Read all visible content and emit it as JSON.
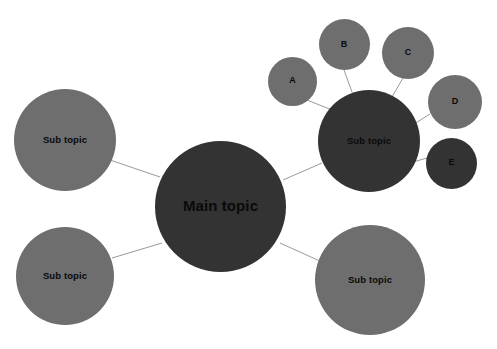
{
  "diagram": {
    "title_text": "Main topic",
    "type": "mind-map",
    "background_color": "#ffffff",
    "link_color": "#9a9a9a",
    "palette": {
      "dark": "#333333",
      "light": "#6e6e6e",
      "text": "#0a0a0a"
    },
    "nodes": [
      {
        "id": "main",
        "label": "Main topic",
        "role": "root",
        "fill": "#333333",
        "cx": 220.5,
        "cy": 206,
        "r": 65.5,
        "font_class": "label-main"
      },
      {
        "id": "sub-left",
        "label": "Sub topic",
        "role": "branch",
        "fill": "#6e6e6e",
        "cx": 65,
        "cy": 140,
        "r": 51,
        "font_class": "label-sub"
      },
      {
        "id": "sub-bottom-left",
        "label": "Sub topic",
        "role": "branch",
        "fill": "#6e6e6e",
        "cx": 65,
        "cy": 276,
        "r": 49,
        "font_class": "label-sub"
      },
      {
        "id": "sub-bottom-right",
        "label": "Sub topic",
        "role": "branch",
        "fill": "#6e6e6e",
        "cx": 370,
        "cy": 280,
        "r": 55,
        "font_class": "label-sub"
      },
      {
        "id": "sub-top-right",
        "label": "Sub topic",
        "role": "branch",
        "fill": "#333333",
        "cx": 369,
        "cy": 141,
        "r": 51,
        "font_class": "label-sub"
      },
      {
        "id": "leaf-a",
        "label": "A",
        "role": "leaf",
        "fill": "#6e6e6e",
        "cx": 292.5,
        "cy": 81,
        "r": 24.5,
        "font_class": "label-leaf"
      },
      {
        "id": "leaf-b",
        "label": "B",
        "role": "leaf",
        "fill": "#6e6e6e",
        "cx": 344,
        "cy": 44.5,
        "r": 25.5,
        "font_class": "label-leaf"
      },
      {
        "id": "leaf-c",
        "label": "C",
        "role": "leaf",
        "fill": "#6e6e6e",
        "cx": 408,
        "cy": 52.5,
        "r": 26,
        "font_class": "label-leaf"
      },
      {
        "id": "leaf-d",
        "label": "D",
        "role": "leaf",
        "fill": "#6e6e6e",
        "cx": 455,
        "cy": 102,
        "r": 27,
        "font_class": "label-leaf"
      },
      {
        "id": "leaf-e",
        "label": "E",
        "role": "leaf",
        "fill": "#333333",
        "cx": 451.5,
        "cy": 163,
        "r": 25.5,
        "font_class": "label-leaf"
      }
    ],
    "links": [
      {
        "id": "link-main-sub-left",
        "from": "main",
        "to": "sub-left",
        "x1": 160,
        "y1": 177,
        "x2": 110,
        "y2": 160
      },
      {
        "id": "link-main-sub-bottom-left",
        "from": "main",
        "to": "sub-bottom-left",
        "x1": 162,
        "y1": 243,
        "x2": 112,
        "y2": 258
      },
      {
        "id": "link-main-sub-top-right",
        "from": "main",
        "to": "sub-top-right",
        "x1": 283,
        "y1": 180,
        "x2": 322,
        "y2": 163
      },
      {
        "id": "link-main-sub-bottom-right",
        "from": "main",
        "to": "sub-bottom-right",
        "x1": 280,
        "y1": 243,
        "x2": 322,
        "y2": 262
      },
      {
        "id": "link-sub-leaf-a",
        "from": "sub-top-right",
        "to": "leaf-a",
        "x1": 332,
        "y1": 110,
        "x2": 307,
        "y2": 100
      },
      {
        "id": "link-sub-leaf-b",
        "from": "sub-top-right",
        "to": "leaf-b",
        "x1": 352,
        "y1": 92,
        "x2": 344,
        "y2": 70
      },
      {
        "id": "link-sub-leaf-c",
        "from": "sub-top-right",
        "to": "leaf-c",
        "x1": 392,
        "y1": 97,
        "x2": 403,
        "y2": 78
      },
      {
        "id": "link-sub-leaf-d",
        "from": "sub-top-right",
        "to": "leaf-d",
        "x1": 414,
        "y1": 124,
        "x2": 430,
        "y2": 114
      },
      {
        "id": "link-sub-leaf-e",
        "from": "sub-top-right",
        "to": "leaf-e",
        "x1": 413,
        "y1": 162,
        "x2": 427,
        "y2": 158
      }
    ]
  }
}
